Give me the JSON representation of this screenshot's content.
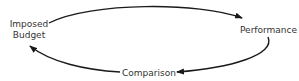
{
  "diagram": {
    "type": "cycle",
    "nodes": [
      {
        "id": "budget",
        "label_line1": "Imposed",
        "label_line2": "Budget"
      },
      {
        "id": "performance",
        "label": "Performance"
      },
      {
        "id": "comparison",
        "label": "Comparison"
      }
    ],
    "edges": [
      {
        "from": "budget",
        "to": "performance"
      },
      {
        "from": "performance",
        "to": "comparison"
      },
      {
        "from": "comparison",
        "to": "budget"
      }
    ],
    "colors": {
      "stroke": "#1a1a1a",
      "text": "#333333",
      "background": "#ffffff"
    }
  }
}
